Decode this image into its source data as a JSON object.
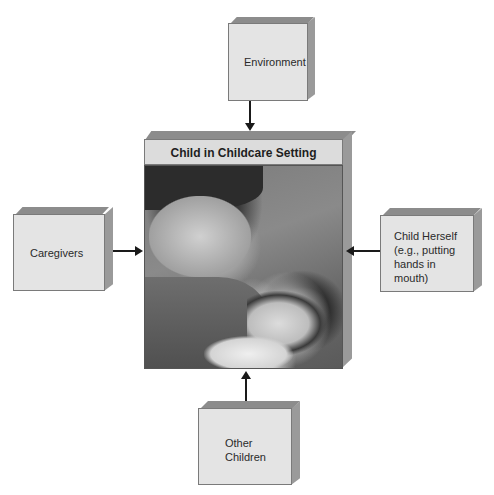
{
  "diagram": {
    "center": {
      "title": "Child in Childcare Setting",
      "image_description": "Photo of adult smiling at infant held in arms"
    },
    "nodes": {
      "top": {
        "label": "Environment"
      },
      "left": {
        "label": "Caregivers"
      },
      "right": {
        "label": "Child Herself (e.g., putting hands in mouth)"
      },
      "bottom": {
        "label": "Other Children"
      }
    },
    "edges": [
      {
        "from": "Environment",
        "to": "Child in Childcare Setting",
        "direction": "down"
      },
      {
        "from": "Caregivers",
        "to": "Child in Childcare Setting",
        "direction": "right"
      },
      {
        "from": "Child Herself (e.g., putting hands in mouth)",
        "to": "Child in Childcare Setting",
        "direction": "left"
      },
      {
        "from": "Other Children",
        "to": "Child in Childcare Setting",
        "direction": "up"
      }
    ],
    "colors": {
      "box_face": "#e4e4e4",
      "box_top": "#8c8c8c",
      "box_side": "#9a9a9a",
      "arrow": "#1a1a1a"
    }
  }
}
